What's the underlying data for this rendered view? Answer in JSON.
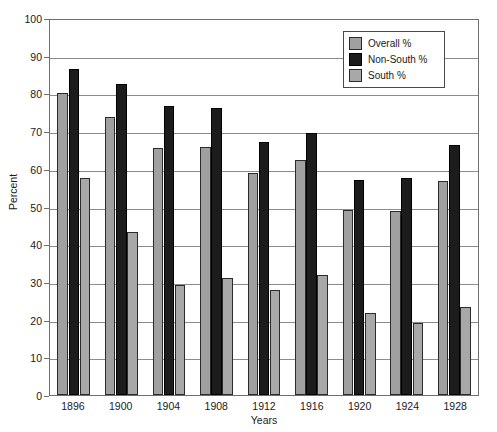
{
  "chart_data": {
    "type": "bar",
    "title": "",
    "xlabel": "Years",
    "ylabel": "Percent",
    "categories": [
      "1896",
      "1900",
      "1904",
      "1908",
      "1912",
      "1916",
      "1920",
      "1924",
      "1928"
    ],
    "series": [
      {
        "name": "Overall %",
        "color": "#a0a0a0",
        "values": [
          80.0,
          73.7,
          65.4,
          65.7,
          59.0,
          62.3,
          49.2,
          48.9,
          56.9
        ]
      },
      {
        "name": "Non-South %",
        "color": "#1c1c1c",
        "values": [
          86.5,
          82.6,
          76.6,
          76.1,
          67.2,
          69.4,
          57.0,
          57.5,
          66.4
        ]
      },
      {
        "name": "South %",
        "color": "#a8a8a8",
        "values": [
          57.5,
          43.3,
          29.1,
          31.0,
          27.8,
          31.9,
          21.8,
          19.0,
          23.3
        ]
      }
    ],
    "ylim": [
      0,
      100
    ],
    "ytick_labels": [
      "100",
      "90",
      "80",
      "70",
      "60",
      "50",
      "40",
      "30",
      "20",
      "10",
      "0"
    ],
    "ytick_values": [
      100,
      90,
      80,
      70,
      60,
      50,
      40,
      30,
      20,
      10,
      0
    ],
    "grid": true,
    "legend_position": "top-right"
  },
  "axes": {
    "y_title": "Percent",
    "x_title": "Years"
  },
  "legend": {
    "entries": [
      {
        "label": "Overall %"
      },
      {
        "label": "Non-South %"
      },
      {
        "label": "South %"
      }
    ]
  }
}
